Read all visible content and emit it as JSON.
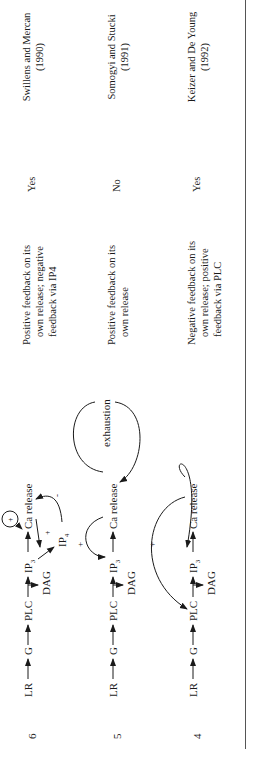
{
  "table": {
    "rows": [
      {
        "number": "4",
        "diagram": {
          "nodes": [
            "LR",
            "G",
            "PLC",
            "IP3",
            "Ca release",
            "DAG"
          ],
          "feedback": [
            {
              "from": "Ca release",
              "to": "PLC",
              "sign": "+"
            },
            {
              "from": "Ca release",
              "to": "IP3",
              "sign": ""
            }
          ]
        },
        "description": [
          "Negative feedback on its",
          "own release; positive",
          "feedback via PLC"
        ],
        "oscillations": "Yes",
        "reference": [
          "Keizer and De Young",
          "(1992)"
        ]
      },
      {
        "number": "5",
        "diagram": {
          "nodes": [
            "LR",
            "G",
            "PLC",
            "IP3",
            "Ca release",
            "DAG"
          ],
          "feedback": [
            {
              "from": "Ca release",
              "to": "IP3",
              "sign": "+"
            },
            {
              "from": "Ca release",
              "to": "Ca release",
              "label": "exhaustion"
            }
          ]
        },
        "description": [
          "Positive feedback on its",
          "own release"
        ],
        "oscillations": "No",
        "reference": [
          "Somogyi and Stucki",
          "(1991)"
        ]
      },
      {
        "number": "6",
        "diagram": {
          "nodes": [
            "LR",
            "G",
            "PLC",
            "IP3",
            "Ca release",
            "DAG",
            "IP4"
          ],
          "feedback": [
            {
              "from": "Ca release",
              "to": "Ca release",
              "sign": "+"
            },
            {
              "from": "Ca release",
              "to": "IP3",
              "sign": "+"
            },
            {
              "from": "IP4",
              "to": "Ca release",
              "sign": "-"
            }
          ]
        },
        "description": [
          "Positive feedback on its",
          "own release; negative",
          "feedback via IP4"
        ],
        "oscillations": "Yes",
        "reference": [
          "Swillens and Mercan",
          "(1990)"
        ]
      }
    ]
  }
}
